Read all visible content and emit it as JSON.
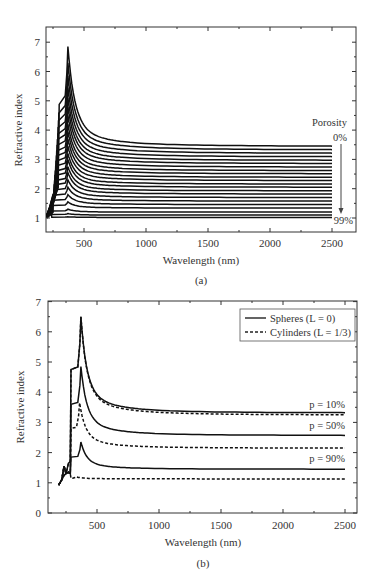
{
  "chart_data": [
    {
      "panel": "(a)",
      "type": "line",
      "title": "",
      "xlabel": "Wavelength (nm)",
      "ylabel": "Refractive index",
      "xlim": [
        200,
        2700
      ],
      "ylim": [
        0.5,
        7.5
      ],
      "xticks": [
        500,
        1000,
        1500,
        2000,
        2500
      ],
      "yticks": [
        1,
        2,
        3,
        4,
        5,
        6,
        7
      ],
      "grid": false,
      "annotations": {
        "legend_title": "Porosity",
        "top_label": "0%",
        "bottom_label": "99%",
        "arrow": "down"
      },
      "series_note": "Family of ~22 curves for porosity from 0% (top) to 99% (bottom); each has a resonance peak near 370 nm and decays to a flat plateau",
      "series": [
        {
          "name": "0%",
          "plateau": 3.45,
          "peak": 6.85
        },
        {
          "name": "5%",
          "plateau": 3.33,
          "peak": 6.3
        },
        {
          "name": "10%",
          "plateau": 3.21,
          "peak": 5.85
        },
        {
          "name": "15%",
          "plateau": 3.09,
          "peak": 5.45
        },
        {
          "name": "20%",
          "plateau": 2.97,
          "peak": 5.1
        },
        {
          "name": "25%",
          "plateau": 2.86,
          "peak": 4.8
        },
        {
          "name": "30%",
          "plateau": 2.74,
          "peak": 4.5
        },
        {
          "name": "35%",
          "plateau": 2.62,
          "peak": 4.2
        },
        {
          "name": "40%",
          "plateau": 2.51,
          "peak": 3.95
        },
        {
          "name": "45%",
          "plateau": 2.39,
          "peak": 3.7
        },
        {
          "name": "50%",
          "plateau": 2.28,
          "peak": 3.45
        },
        {
          "name": "55%",
          "plateau": 2.16,
          "peak": 3.2
        },
        {
          "name": "60%",
          "plateau": 2.05,
          "peak": 3.0
        },
        {
          "name": "65%",
          "plateau": 1.93,
          "peak": 2.75
        },
        {
          "name": "70%",
          "plateau": 1.82,
          "peak": 2.55
        },
        {
          "name": "75%",
          "plateau": 1.7,
          "peak": 2.3
        },
        {
          "name": "80%",
          "plateau": 1.58,
          "peak": 2.05
        },
        {
          "name": "85%",
          "plateau": 1.46,
          "peak": 1.8
        },
        {
          "name": "90%",
          "plateau": 1.34,
          "peak": 1.55
        },
        {
          "name": "95%",
          "plateau": 1.2,
          "peak": 1.3
        },
        {
          "name": "97%",
          "plateau": 1.1,
          "peak": 1.15
        },
        {
          "name": "99%",
          "plateau": 1.02,
          "peak": 1.04
        }
      ],
      "caption": "(a)"
    },
    {
      "panel": "(b)",
      "type": "line",
      "title": "",
      "xlabel": "Wavelength (nm)",
      "ylabel": "Refractive index",
      "xlim": [
        150,
        2650
      ],
      "ylim": [
        0,
        7
      ],
      "xticks": [
        500,
        1000,
        1500,
        2000,
        2500
      ],
      "yticks": [
        0,
        1,
        2,
        3,
        4,
        5,
        6,
        7
      ],
      "grid": false,
      "legend": {
        "position": "upper right",
        "entries": [
          {
            "label": "Spheres (L = 0)",
            "style": "solid"
          },
          {
            "label": "Cylinders (L = 1/3)",
            "style": "dashed"
          }
        ]
      },
      "annotations": [
        "p = 10%",
        "p = 50%",
        "p = 90%"
      ],
      "series": [
        {
          "name": "Spheres p = 10%",
          "style": "solid",
          "peak_x": 370,
          "peak": 6.5,
          "shoulder": 4.75,
          "plateau": 3.32
        },
        {
          "name": "Cylinders p = 10%",
          "style": "dashed",
          "peak_x": 370,
          "peak": 6.5,
          "shoulder": 4.75,
          "plateau": 3.25
        },
        {
          "name": "Spheres p = 50%",
          "style": "solid",
          "peak_x": 370,
          "peak": 4.85,
          "shoulder": 3.6,
          "plateau": 2.57
        },
        {
          "name": "Cylinders p = 50%",
          "style": "dashed",
          "peak_x": 360,
          "peak": 3.65,
          "shoulder": 2.8,
          "plateau": 2.15
        },
        {
          "name": "Spheres p = 90%",
          "style": "solid",
          "peak_x": 370,
          "peak": 2.35,
          "shoulder": 1.85,
          "plateau": 1.45
        },
        {
          "name": "Cylinders p = 90%",
          "style": "dashed",
          "peak_x": 330,
          "peak": 1.2,
          "shoulder": 1.15,
          "plateau": 1.13
        }
      ],
      "caption": "(b)"
    }
  ],
  "panels": {
    "a": {
      "ylabel": "Refractive index",
      "xlabel": "Wavelength (nm)",
      "caption": "(a)",
      "porosity_title": "Porosity",
      "porosity_top": "0%",
      "porosity_bottom": "99%",
      "xticks": [
        "500",
        "1000",
        "1500",
        "2000",
        "2500"
      ],
      "yticks": [
        "1",
        "2",
        "3",
        "4",
        "5",
        "6",
        "7"
      ]
    },
    "b": {
      "ylabel": "Refractive index",
      "xlabel": "Wavelength (nm)",
      "caption": "(b)",
      "legend_solid": "Spheres (L = 0)",
      "legend_dashed": "Cylinders (L = 1/3)",
      "label_p10": "p = 10%",
      "label_p50": "p = 50%",
      "label_p90": "p = 90%",
      "xticks": [
        "500",
        "1000",
        "1500",
        "2000",
        "2500"
      ],
      "yticks": [
        "0",
        "1",
        "2",
        "3",
        "4",
        "5",
        "6",
        "7"
      ]
    }
  }
}
